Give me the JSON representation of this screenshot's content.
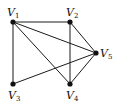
{
  "diagram": {
    "type": "graph",
    "directed": false,
    "nodes": [
      {
        "id": "V1",
        "letter": "V",
        "sub": "1",
        "x": 13,
        "y": 22,
        "lx": 7,
        "ly": 16
      },
      {
        "id": "V2",
        "letter": "V",
        "sub": "2",
        "x": 70,
        "y": 22,
        "lx": 66,
        "ly": 16
      },
      {
        "id": "V3",
        "letter": "V",
        "sub": "3",
        "x": 13,
        "y": 84,
        "lx": 8,
        "ly": 99
      },
      {
        "id": "V4",
        "letter": "V",
        "sub": "4",
        "x": 70,
        "y": 84,
        "lx": 66,
        "ly": 99
      },
      {
        "id": "V5",
        "letter": "V",
        "sub": "5",
        "x": 96,
        "y": 53,
        "lx": 100,
        "ly": 57
      }
    ],
    "edges": [
      [
        "V1",
        "V2"
      ],
      [
        "V1",
        "V3"
      ],
      [
        "V1",
        "V4"
      ],
      [
        "V1",
        "V5"
      ],
      [
        "V2",
        "V4"
      ],
      [
        "V2",
        "V5"
      ],
      [
        "V3",
        "V5"
      ],
      [
        "V4",
        "V5"
      ]
    ],
    "colors": {
      "edge": "#1a1a1a",
      "node": "#111111",
      "background": "#ffffff"
    }
  }
}
